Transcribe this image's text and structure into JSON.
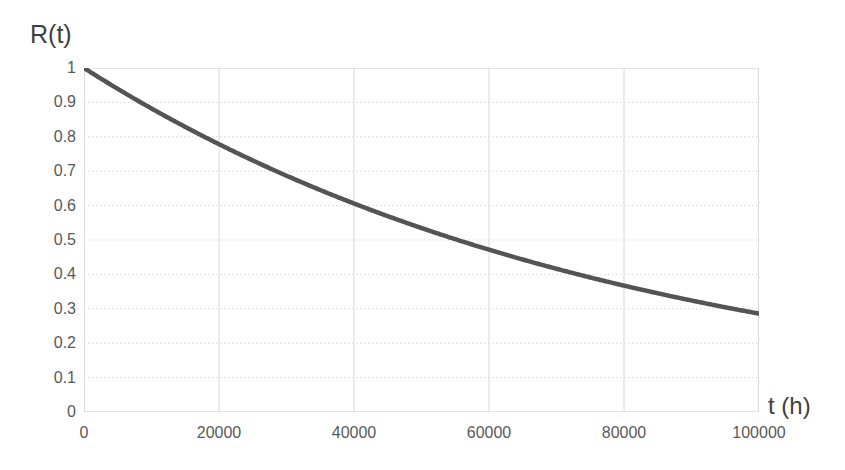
{
  "chart_data": {
    "type": "line",
    "title": "",
    "xlabel": "t (h)",
    "ylabel": "R(t)",
    "xlim": [
      0,
      100000
    ],
    "ylim": [
      0,
      1
    ],
    "grid": true,
    "legend": "none",
    "x_ticks": [
      "0",
      "20000",
      "40000",
      "60000",
      "80000",
      "100000"
    ],
    "x_tick_values": [
      0,
      20000,
      40000,
      60000,
      80000,
      100000
    ],
    "y_ticks": [
      "0",
      "0.1",
      "0.2",
      "0.3",
      "0.4",
      "0.5",
      "0.6",
      "0.7",
      "0.8",
      "0.9",
      "1"
    ],
    "y_tick_values": [
      0,
      0.1,
      0.2,
      0.3,
      0.4,
      0.5,
      0.6,
      0.7,
      0.8,
      0.9,
      1
    ],
    "series": [
      {
        "name": "R(t)",
        "color": "#545454",
        "x": [
          0,
          5000,
          10000,
          15000,
          20000,
          25000,
          30000,
          35000,
          40000,
          45000,
          50000,
          55000,
          60000,
          65000,
          70000,
          75000,
          80000,
          85000,
          90000,
          95000,
          100000
        ],
        "values": [
          1.0,
          0.939,
          0.882,
          0.829,
          0.779,
          0.732,
          0.687,
          0.646,
          0.607,
          0.57,
          0.535,
          0.503,
          0.472,
          0.444,
          0.417,
          0.392,
          0.368,
          0.345,
          0.324,
          0.305,
          0.286
        ]
      }
    ]
  },
  "axis": {
    "y_title": "R(t)",
    "x_title": "t (h)"
  },
  "style": {
    "line_color": "#545454",
    "grid_color": "#d9d9d9",
    "axis_color": "#d0d0d0",
    "tick_label_color": "#595959",
    "axis_title_color": "#3f3f3f",
    "background": "#ffffff"
  }
}
